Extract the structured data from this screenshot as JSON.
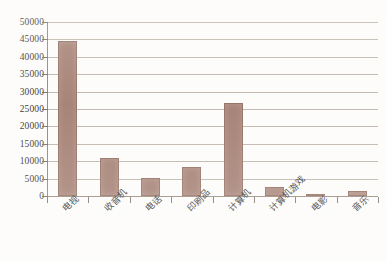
{
  "chart_data": {
    "type": "bar",
    "title": "",
    "subtitle": "",
    "xlabel": "",
    "ylabel": "",
    "categories": [
      "电视",
      "收音机",
      "电话",
      "印刷品",
      "计算机",
      "计算机游戏",
      "电影",
      "音乐"
    ],
    "values": [
      44500,
      11000,
      5200,
      8200,
      26800,
      2600,
      600,
      1300
    ],
    "series": [
      {
        "name": "媒体使用时间",
        "values": [
          44500,
          11000,
          5200,
          8200,
          26800,
          2600,
          600,
          1300
        ]
      }
    ],
    "ylim": [
      0,
      50000
    ],
    "ytick_step": 5000,
    "ytick_labels": [
      "0",
      "5000",
      "10000",
      "15000",
      "20000",
      "25000",
      "30000",
      "35000",
      "40000",
      "45000",
      "50000"
    ],
    "ytick_values": [
      0,
      5000,
      10000,
      15000,
      20000,
      25000,
      30000,
      35000,
      40000,
      45000,
      50000
    ],
    "grid": true,
    "grid_axis": "y",
    "legend": false,
    "legend_position": "none",
    "bar_color": "#9c7467",
    "bar_edge_color": "#8a6356",
    "gridline_color": "#a89a8e",
    "axis_color": "#8a7c70",
    "background_color": "#fdfdfc",
    "text_color": "#1b1b1b",
    "annotations": []
  }
}
